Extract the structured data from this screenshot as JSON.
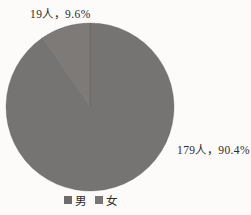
{
  "chart_data": {
    "type": "pie",
    "title": "",
    "unit": "人",
    "categories": [
      "男",
      "女"
    ],
    "values": [
      179,
      19
    ],
    "total": 198,
    "slices": [
      {
        "label": "男",
        "value": 179,
        "percent": 90.4,
        "display_label": "179人，90.4%",
        "color": "#767473"
      },
      {
        "label": "女",
        "value": 19,
        "percent": 9.6,
        "display_label": "19人，9.6%",
        "color": "#7d7a78"
      }
    ],
    "start_angle_deg": 0,
    "direction": "clockwise",
    "legend_position": "bottom",
    "slice_border_color": "rgba(95,92,90,0.45)"
  },
  "legend": {
    "items": [
      {
        "label": "男",
        "swatch_color": "#6e6b69"
      },
      {
        "label": "女",
        "swatch_color": "#787573"
      }
    ]
  },
  "canvas": {
    "background": "#fcfbf9",
    "text_color": "#2e2b29"
  }
}
